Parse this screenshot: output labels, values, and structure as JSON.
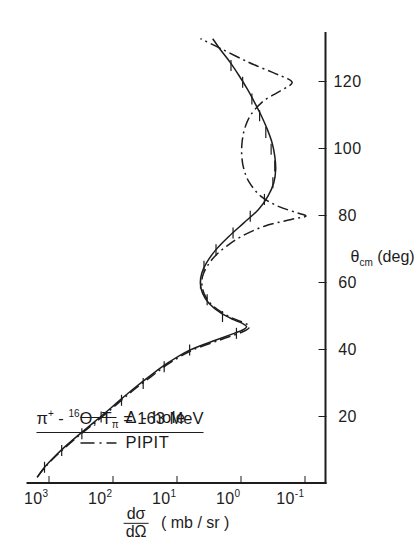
{
  "figure": {
    "title_parts": {
      "particle": "π",
      "charge": "+",
      "dash": " - ",
      "mass": "16",
      "target": "O,",
      "energy_symbol": "T",
      "energy_sub": "π",
      "energy_value": " = 163 MeV"
    },
    "title_plain": "π+ - 16O, Tπ = 163 MeV",
    "rotation_note": "figure printed rotated 90 degrees"
  },
  "legend": {
    "position": "upper-left",
    "entries": [
      {
        "label": "Δ - hole",
        "style": "solid",
        "sample": "solid-line-sample"
      },
      {
        "label": "PIPIT",
        "style": "dashdot",
        "sample": "dashdot-line-sample"
      }
    ]
  },
  "axes": {
    "x": {
      "title_main": "θ",
      "title_sub": "cm",
      "title_unit": " (deg)",
      "title_plain": "θcm (deg)",
      "ticks": [
        "20",
        "40",
        "60",
        "80",
        "100",
        "120"
      ],
      "tick_values": [
        20,
        40,
        60,
        80,
        100,
        120
      ],
      "range": [
        0,
        135
      ]
    },
    "y": {
      "title_numerator": "dσ",
      "title_denominator": "dΩ",
      "title_unit": "( mb / sr )",
      "title_plain": "dσ/dΩ ( mb / sr )",
      "ticks": [
        "10",
        "10",
        "10",
        "10",
        "10"
      ],
      "tick_exponents": [
        "3",
        "2",
        "1",
        "0",
        "-1"
      ],
      "tick_values": [
        1000,
        100,
        10,
        1,
        0.1
      ],
      "range": [
        0.045,
        2200
      ],
      "scale": "log"
    }
  },
  "colors": {
    "ink": "#1d1d1d",
    "background": "#ffffff"
  },
  "chart_data": {
    "type": "line",
    "xlabel": "θcm (deg)",
    "ylabel": "dσ/dΩ ( mb / sr )",
    "yscale": "log",
    "xlim": [
      0,
      135
    ],
    "ylim": [
      0.045,
      2200
    ],
    "grid": false,
    "legend_position": "upper-left",
    "series": [
      {
        "name": "Δ - hole",
        "style": "solid",
        "x": [
          2,
          5,
          8,
          11,
          14,
          17,
          20,
          24,
          28,
          32,
          36,
          40,
          43,
          45,
          46,
          47,
          48,
          49,
          51,
          54,
          57,
          60,
          63,
          66,
          70,
          74,
          78,
          82,
          86,
          90,
          94,
          98,
          102,
          106,
          110,
          114,
          118,
          122,
          126,
          130,
          133
        ],
        "y": [
          1500,
          1150,
          820,
          560,
          370,
          240,
          155,
          88,
          50,
          27,
          14,
          6.2,
          2.4,
          1.25,
          0.92,
          0.8,
          0.93,
          1.25,
          2.0,
          3.1,
          3.9,
          4.2,
          4.0,
          3.4,
          2.4,
          1.5,
          0.88,
          0.52,
          0.37,
          0.3,
          0.28,
          0.29,
          0.32,
          0.38,
          0.47,
          0.6,
          0.78,
          1.05,
          1.45,
          2.1,
          2.7
        ]
      },
      {
        "name": "PIPIT",
        "style": "dashdot",
        "x": [
          2,
          5,
          8,
          11,
          14,
          17,
          20,
          24,
          28,
          32,
          36,
          40,
          43,
          45,
          46,
          47,
          48,
          50,
          53,
          56,
          59,
          62,
          65,
          68,
          71,
          74,
          77,
          79,
          80,
          81,
          83,
          86,
          90,
          94,
          98,
          102,
          106,
          110,
          114,
          117,
          119,
          120,
          121,
          123,
          126,
          130,
          133
        ],
        "y": [
          1500,
          1130,
          800,
          540,
          355,
          228,
          146,
          83,
          47,
          25,
          13,
          5.6,
          2.1,
          1.05,
          0.8,
          0.72,
          0.84,
          1.5,
          2.6,
          3.5,
          3.95,
          3.9,
          3.3,
          2.5,
          1.65,
          0.95,
          0.42,
          0.16,
          0.095,
          0.13,
          0.26,
          0.48,
          0.72,
          0.88,
          0.95,
          0.94,
          0.86,
          0.7,
          0.46,
          0.26,
          0.17,
          0.155,
          0.18,
          0.32,
          0.75,
          2.0,
          4.2
        ]
      }
    ],
    "data_points": {
      "name": "measured cross sections",
      "marker": "error-bar-ticks",
      "x": [
        5,
        10,
        15,
        20,
        25,
        30,
        35,
        40,
        45,
        50,
        55,
        60,
        65,
        70,
        75,
        80,
        85,
        90,
        95,
        100,
        105,
        110,
        115,
        120,
        125
      ],
      "y": [
        1150,
        620,
        300,
        150,
        72,
        33,
        15.5,
        6.2,
        1.15,
        1.9,
        3.3,
        4.2,
        3.7,
        2.4,
        1.3,
        0.7,
        0.42,
        0.31,
        0.29,
        0.33,
        0.4,
        0.5,
        0.66,
        0.92,
        1.4
      ]
    }
  }
}
